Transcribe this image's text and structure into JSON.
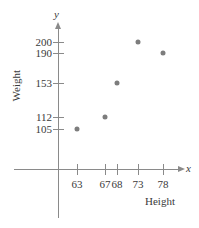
{
  "chart_data": {
    "type": "scatter",
    "title": "",
    "xlabel": "Height",
    "ylabel": "Weight",
    "x_var_symbol": "x",
    "y_var_symbol": "y",
    "xticklabels": [
      "63",
      "67",
      "68",
      "73",
      "78"
    ],
    "yticklabels": [
      "105",
      "112",
      "153",
      "190",
      "200"
    ],
    "x": [
      63,
      67,
      68,
      73,
      78
    ],
    "values": [
      105,
      112,
      153,
      200,
      190
    ],
    "points": [
      {
        "x": 63,
        "y": 105
      },
      {
        "x": 67,
        "y": 112
      },
      {
        "x": 68,
        "y": 153
      },
      {
        "x": 73,
        "y": 200
      },
      {
        "x": 78,
        "y": 190
      }
    ],
    "grid": false,
    "legend": null,
    "marker_color": "#7d7d7d",
    "axis_color": "#8a8a8a"
  },
  "pixels": {
    "ticks_y": [
      {
        "label": "200",
        "top": 42
      },
      {
        "label": "190",
        "top": 53
      },
      {
        "label": "153",
        "top": 83
      },
      {
        "label": "112",
        "top": 117
      },
      {
        "label": "105",
        "top": 129
      }
    ],
    "ticks_x": [
      {
        "label": "63",
        "left": 77
      },
      {
        "label": "67",
        "left": 105
      },
      {
        "label": "68",
        "left": 117
      },
      {
        "label": "73",
        "left": 138
      },
      {
        "label": "78",
        "left": 163
      }
    ],
    "points": [
      {
        "left": 77,
        "top": 129
      },
      {
        "left": 105,
        "top": 117
      },
      {
        "left": 117,
        "top": 83
      },
      {
        "left": 138,
        "top": 42
      },
      {
        "left": 163,
        "top": 53
      }
    ]
  }
}
